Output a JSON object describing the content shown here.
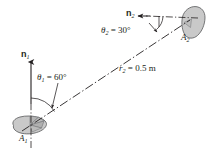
{
  "figure": {
    "kind": "radiation-view-factor-geometry-diagram",
    "background_color": "#ffffff",
    "line_color": "#231f20",
    "surface_fill_color": "#c9c9c9",
    "surface_edge_color": "#58595b",
    "width_px": 211,
    "height_px": 148
  },
  "labels": {
    "normal_1": {
      "symbol": "n",
      "subscript": "1"
    },
    "normal_2": {
      "symbol": "n",
      "subscript": "2"
    },
    "angle_1": {
      "symbol": "θ",
      "subscript": "1",
      "equals": " = ",
      "value": "60°"
    },
    "angle_2": {
      "symbol": "θ",
      "subscript": "2",
      "equals": " = ",
      "value": "30°"
    },
    "area_1": {
      "symbol": "A",
      "subscript": "1"
    },
    "area_2": {
      "symbol": "A",
      "subscript": "2"
    },
    "distance": {
      "symbol": "r",
      "subscript": "2",
      "equals": " = ",
      "value": "0.5 m"
    }
  },
  "geometry": {
    "surface_1_center": {
      "x": 30,
      "y": 125
    },
    "surface_2_center": {
      "x": 190,
      "y": 22
    },
    "ray_start": {
      "x": 36,
      "y": 121
    },
    "ray_end": {
      "x": 183,
      "y": 24
    },
    "normal_1_tip": {
      "x": 31,
      "y": 60
    },
    "normal_2_tip": {
      "x": 139,
      "y": 14
    },
    "angle_1_degrees": 60,
    "angle_2_degrees": 30
  }
}
